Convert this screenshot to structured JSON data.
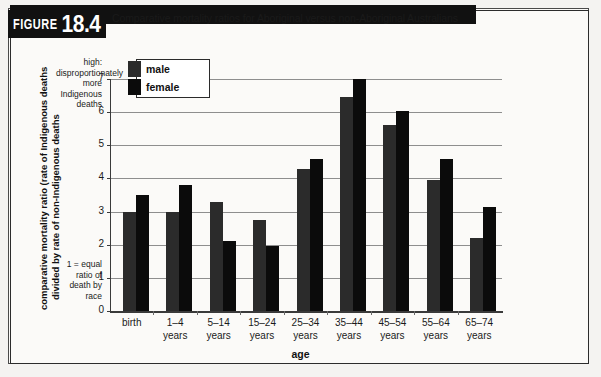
{
  "figure": {
    "word": "FIGURE",
    "number": "18.4",
    "title": "Comparative mortality ratios for Aboriginal versus non-Aboriginal Australians"
  },
  "annotations": {
    "high": "high: disproportionately more Indigenous deaths",
    "baseline": "1 = equal ratio of death by race"
  },
  "legend": {
    "items": [
      {
        "label": "male",
        "color": "#2b2b2b"
      },
      {
        "label": "female",
        "color": "#0b0b0b"
      }
    ]
  },
  "axes": {
    "y_title_line1": "comparative mortality ratio (rate of Indigenous deaths",
    "y_title_line2": "divided by rate of non-Indigenous deaths",
    "x_title": "age",
    "y_ticks": [
      "7",
      "6",
      "5",
      "4",
      "3",
      "2",
      "1",
      "0"
    ]
  },
  "chart_data": {
    "type": "bar",
    "title": "Comparative mortality ratios for Aboriginal versus non-Aboriginal Australians",
    "xlabel": "age",
    "ylabel": "comparative mortality ratio (rate of Indigenous deaths divided by rate of non-Indigenous deaths",
    "ylim": [
      0,
      7
    ],
    "ytick_step": 1,
    "grid": true,
    "legend_position": "top-left inside plot",
    "categories": [
      "birth",
      "1–4 years",
      "5–14 years",
      "15–24 years",
      "25–34 years",
      "35–44 years",
      "45–54 years",
      "55–64 years",
      "65–74 years"
    ],
    "category_lines": [
      [
        "birth",
        ""
      ],
      [
        "1–4",
        "years"
      ],
      [
        "5–14",
        "years"
      ],
      [
        "15–24",
        "years"
      ],
      [
        "25–34",
        "years"
      ],
      [
        "35–44",
        "years"
      ],
      [
        "45–54",
        "years"
      ],
      [
        "55–64",
        "years"
      ],
      [
        "65–74",
        "years"
      ]
    ],
    "series": [
      {
        "name": "male",
        "color": "#2b2b2b",
        "values": [
          3.0,
          3.0,
          3.3,
          2.75,
          4.3,
          6.45,
          5.6,
          3.95,
          2.2
        ]
      },
      {
        "name": "female",
        "color": "#0b0b0b",
        "values": [
          3.5,
          3.8,
          2.1,
          1.95,
          4.6,
          7.0,
          6.05,
          4.6,
          3.15
        ]
      }
    ]
  }
}
